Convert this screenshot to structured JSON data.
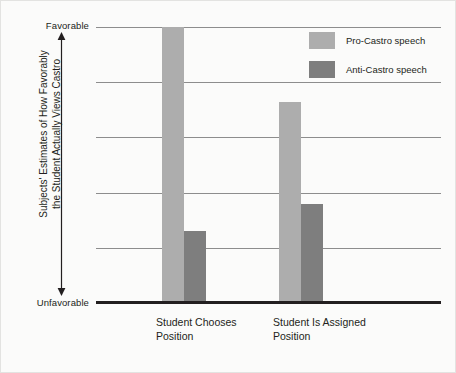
{
  "chart_data": {
    "type": "bar",
    "title": "",
    "xlabel": "",
    "ylabel": "Subjects' Estimates of How Favorably the Student Actually Views Castro",
    "ylabel_lines": [
      "Subjects' Estimates of How Favorably",
      "the Student Actually Views Castro"
    ],
    "categories": [
      "Student Chooses Position",
      "Student Is Assigned Position"
    ],
    "category_label_lines": [
      [
        "Student Chooses",
        "Position"
      ],
      [
        "Student Is Assigned",
        "Position"
      ]
    ],
    "series": [
      {
        "name": "Pro-Castro speech",
        "color": "#adadad",
        "values": [
          100,
          73
        ]
      },
      {
        "name": "Anti-Castro speech",
        "color": "#7e7e7e",
        "values": [
          26,
          36
        ]
      }
    ],
    "ylim": [
      0,
      100
    ],
    "y_axis_endpoints": {
      "high": "Favorable",
      "low": "Unfavorable"
    },
    "y_tick_labels": [
      "Unfavorable",
      "Favorable"
    ],
    "gridlines": [
      0,
      20,
      40,
      60,
      80,
      100
    ],
    "grid": true,
    "legend_position": "top-right"
  },
  "axis": {
    "favorable": "Favorable",
    "unfavorable": "Unfavorable",
    "title_line_1": "Subjects' Estimates of How Favorably",
    "title_line_2": "the Student Actually Views Castro"
  },
  "legend": {
    "entries": [
      {
        "label": "Pro-Castro speech"
      },
      {
        "label": "Anti-Castro speech"
      }
    ]
  },
  "categories": [
    {
      "line1": "Student Chooses",
      "line2": "Position"
    },
    {
      "line1": "Student Is Assigned",
      "line2": "Position"
    }
  ],
  "colors": {
    "pro": "#adadad",
    "anti": "#7e7e7e",
    "axis": "#231f20",
    "grid": "#8d8d8d"
  }
}
